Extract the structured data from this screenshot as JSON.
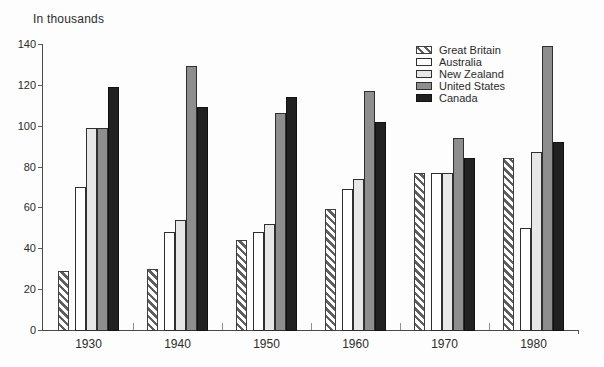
{
  "title": "In thousands",
  "colors": {
    "background": "#fdfdfd",
    "axis": "#4a4a4a",
    "text": "#2b2b2b",
    "hatch_stripe": "#5f5f5f",
    "australia_fill": "#ffffff",
    "new_zealand_fill": "#e7e7e7",
    "united_states_fill": "#8e8e8e",
    "canada_fill": "#212121"
  },
  "chart_data": {
    "type": "bar",
    "title": "In thousands",
    "xlabel": "",
    "ylabel": "In thousands",
    "categories": [
      "1930",
      "1940",
      "1950",
      "1960",
      "1970",
      "1980"
    ],
    "series": [
      {
        "name": "Great Britain",
        "style": "hatched",
        "values": [
          29,
          30,
          44,
          59,
          77,
          84
        ]
      },
      {
        "name": "Australia",
        "style": "white",
        "values": [
          70,
          48,
          48,
          69,
          77,
          50
        ]
      },
      {
        "name": "New Zealand",
        "style": "light-gray",
        "values": [
          99,
          54,
          52,
          74,
          77,
          87
        ]
      },
      {
        "name": "United States",
        "style": "gray",
        "values": [
          99,
          129,
          106,
          117,
          94,
          139
        ]
      },
      {
        "name": "Canada",
        "style": "black",
        "values": [
          119,
          109,
          114,
          102,
          84,
          92
        ]
      }
    ],
    "ylim": [
      0,
      140
    ],
    "yticks": [
      0,
      20,
      40,
      60,
      80,
      100,
      120,
      140
    ],
    "grid": false,
    "legend_position": "top-right"
  }
}
